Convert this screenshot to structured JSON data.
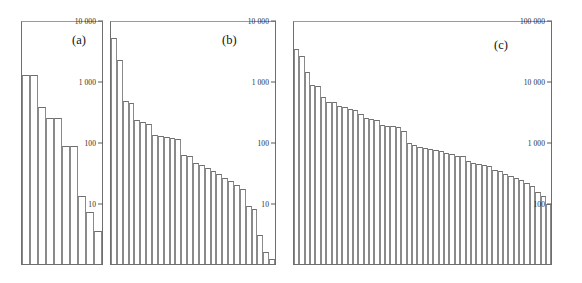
{
  "figure": {
    "background": "#ffffff",
    "bar_edge_color": "#8a8a8a",
    "axis_color": "#6e6e6e",
    "width": 582,
    "height": 283
  },
  "chart_data": [
    {
      "type": "bar",
      "panel": "a",
      "label": "(a)",
      "title": "",
      "xlabel": "",
      "ylabel": "",
      "yscale": "log",
      "ylim": [
        1,
        10000
      ],
      "grid": false,
      "legend": null,
      "ytick_labels": [
        "10 000",
        "1 000",
        "100",
        "10"
      ],
      "ytick_values": [
        10000,
        1000,
        100,
        10
      ],
      "categories": [
        "1",
        "2",
        "3",
        "4",
        "5",
        "6",
        "7",
        "8",
        "9",
        "10"
      ],
      "values": [
        1250,
        1250,
        380,
        250,
        250,
        85,
        85,
        13,
        7,
        3.5
      ],
      "bar_count": 10
    },
    {
      "type": "bar",
      "panel": "b",
      "label": "(b)",
      "title": "",
      "xlabel": "",
      "ylabel": "",
      "yscale": "log",
      "ylim": [
        1,
        10000
      ],
      "grid": false,
      "legend": null,
      "ytick_labels": [
        "10 000",
        "1 000",
        "100",
        "10"
      ],
      "ytick_values": [
        10000,
        1000,
        100,
        10
      ],
      "categories": [
        "1",
        "2",
        "3",
        "4",
        "5",
        "6",
        "7",
        "8",
        "9",
        "10",
        "11",
        "12",
        "13",
        "14",
        "15",
        "16",
        "17",
        "18",
        "19",
        "20",
        "21",
        "22",
        "23",
        "24",
        "25",
        "26",
        "27",
        "28"
      ],
      "values": [
        5000,
        2200,
        470,
        430,
        230,
        215,
        200,
        130,
        125,
        120,
        115,
        110,
        62,
        58,
        45,
        42,
        38,
        34,
        30,
        26,
        23,
        20,
        17,
        9,
        8,
        3,
        1.6,
        1.2
      ],
      "bar_count": 28
    },
    {
      "type": "bar",
      "panel": "c",
      "label": "(c)",
      "title": "",
      "xlabel": "",
      "ylabel": "",
      "yscale": "log",
      "ylim": [
        10,
        100000
      ],
      "grid": false,
      "legend": null,
      "ytick_labels": [
        "100 000",
        "10 000",
        "1 000",
        "100"
      ],
      "ytick_values": [
        100000,
        10000,
        1000,
        100
      ],
      "categories": [
        "1",
        "2",
        "3",
        "4",
        "5",
        "6",
        "7",
        "8",
        "9",
        "10",
        "11",
        "12",
        "13",
        "14",
        "15",
        "16",
        "17",
        "18",
        "19",
        "20",
        "21",
        "22",
        "23",
        "24",
        "25",
        "26",
        "27",
        "28",
        "29",
        "30",
        "31",
        "32",
        "33",
        "34",
        "35",
        "36",
        "37",
        "38",
        "39",
        "40",
        "41",
        "42",
        "43",
        "44",
        "45",
        "46",
        "47",
        "48"
      ],
      "values": [
        33000,
        26000,
        14000,
        8500,
        8200,
        5400,
        4600,
        4500,
        3900,
        3800,
        3500,
        3300,
        2900,
        2500,
        2400,
        2300,
        1900,
        1850,
        1800,
        1750,
        1500,
        980,
        900,
        840,
        800,
        760,
        740,
        700,
        670,
        640,
        600,
        580,
        480,
        460,
        440,
        420,
        400,
        350,
        330,
        300,
        280,
        260,
        240,
        210,
        190,
        150,
        130,
        95
      ],
      "bar_count": 48
    }
  ]
}
